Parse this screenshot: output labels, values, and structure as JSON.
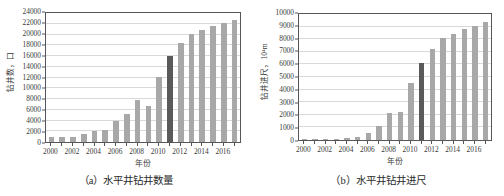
{
  "figure": {
    "panels": [
      {
        "id": "panel-a",
        "caption": "（a）水平井钻井数量",
        "chart_data": {
          "type": "bar",
          "title": "",
          "xlabel": "年份",
          "ylabel": "钻井数，口",
          "ylim": [
            0,
            24000
          ],
          "ytick_step": 2000,
          "yticks": [
            0,
            2000,
            4000,
            6000,
            8000,
            10000,
            12000,
            14000,
            16000,
            18000,
            20000,
            22000,
            24000
          ],
          "grid": true,
          "legend": "none",
          "xlim_years": [
            2000,
            2017
          ],
          "xtick_labels": [
            "2000",
            "2002",
            "2004",
            "2006",
            "2008",
            "2010",
            "2012",
            "2014",
            "2016"
          ],
          "categories": [
            2000,
            2001,
            2002,
            2003,
            2004,
            2005,
            2006,
            2007,
            2008,
            2009,
            2010,
            2011,
            2012,
            2013,
            2014,
            2015,
            2016,
            2017
          ],
          "values": [
            900,
            900,
            850,
            1400,
            2100,
            2250,
            3900,
            5150,
            7800,
            6700,
            12150,
            16050,
            18450,
            20150,
            20800,
            21600,
            22150,
            22650
          ],
          "highlight_category": 2011,
          "colors": {
            "bar": "#a8a8a8",
            "bar_highlight": "#5a5a5a",
            "grid": "#d9d9db",
            "axis": "#55555a",
            "text": "#3a3a3a"
          }
        }
      },
      {
        "id": "panel-b",
        "caption": "（b）水平井钻井进尺",
        "chart_data": {
          "type": "bar",
          "title": "",
          "xlabel": "年份",
          "ylabel": "钻井进尺，10⁴m",
          "ylim": [
            0,
            10000
          ],
          "ytick_step": 1000,
          "yticks": [
            0,
            1000,
            2000,
            3000,
            4000,
            5000,
            6000,
            7000,
            8000,
            9000,
            10000
          ],
          "grid": true,
          "legend": "none",
          "xlim_years": [
            2000,
            2017
          ],
          "xtick_labels": [
            "2000",
            "2002",
            "2004",
            "2006",
            "2008",
            "2010",
            "2012",
            "2014",
            "2016"
          ],
          "categories": [
            2000,
            2001,
            2002,
            2003,
            2004,
            2005,
            2006,
            2007,
            2008,
            2009,
            2010,
            2011,
            2012,
            2013,
            2014,
            2015,
            2016,
            2017
          ],
          "values": [
            60,
            60,
            60,
            70,
            130,
            230,
            580,
            1130,
            2150,
            2230,
            4530,
            6150,
            7230,
            8080,
            8400,
            8800,
            9070,
            9400
          ],
          "highlight_category": 2011,
          "colors": {
            "bar": "#a8a8a8",
            "bar_highlight": "#5a5a5a",
            "grid": "#d9d9db",
            "axis": "#55555a",
            "text": "#3a3a3a"
          }
        }
      }
    ]
  }
}
